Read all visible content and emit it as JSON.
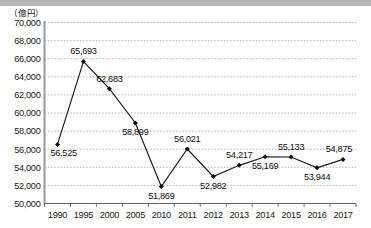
{
  "unit_label": "（億円）",
  "chart_data": {
    "type": "line",
    "title": "",
    "xlabel": "",
    "ylabel": "（億円）",
    "categories": [
      "1990",
      "1995",
      "2000",
      "2005",
      "2010",
      "2011",
      "2012",
      "2013",
      "2014",
      "2015",
      "2016",
      "2017"
    ],
    "values": [
      56525,
      65693,
      62683,
      58899,
      51869,
      56021,
      52982,
      54217,
      55169,
      55133,
      53944,
      54875
    ],
    "point_labels": [
      "56,525",
      "65,693",
      "62,683",
      "58,899",
      "51,869",
      "56,021",
      "52,982",
      "54,217",
      "55,169",
      "55,133",
      "53,944",
      "54,875"
    ],
    "label_positions": [
      "below",
      "above",
      "above",
      "below",
      "below",
      "above",
      "below",
      "above",
      "below",
      "above",
      "below",
      "above"
    ],
    "ylim": [
      50000,
      70000
    ],
    "ytick_values": [
      50000,
      52000,
      54000,
      56000,
      58000,
      60000,
      62000,
      64000,
      66000,
      68000,
      70000
    ],
    "ytick_labels": [
      "50,000",
      "52,000",
      "54,000",
      "56,000",
      "58,000",
      "60,000",
      "62,000",
      "64,000",
      "66,000",
      "68,000",
      "70,000"
    ],
    "grid": true,
    "legend": "none",
    "marker": "diamond",
    "line_color": "#1a1a1a",
    "marker_color": "#0d0d0d",
    "grid_color": "#9a9a9a",
    "accent_color": "#b5b5b5"
  }
}
